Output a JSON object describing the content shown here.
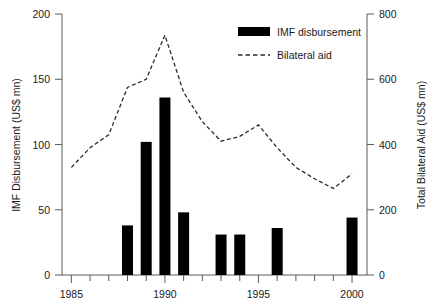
{
  "chart_data": {
    "type": "bar",
    "title": "",
    "xlabel": "",
    "ylabel": "IMF Disbursement (US$ mn)",
    "y2label": "Total Bilateral Aid (US$ mn)",
    "xlim": [
      1984.5,
      2000.8
    ],
    "ylim": [
      0,
      200
    ],
    "y2lim": [
      0,
      800
    ],
    "grid": false,
    "legend_position": "top-right",
    "x_ticks_major": [
      1985,
      1990,
      1995,
      2000
    ],
    "x_tick_labels": [
      "1985",
      "1990",
      "1995",
      "2000"
    ],
    "x_ticks_minor": [
      1986,
      1987,
      1988,
      1989,
      1991,
      1992,
      1993,
      1994,
      1996,
      1997,
      1998,
      1999
    ],
    "y_ticks": [
      0,
      50,
      100,
      150,
      200
    ],
    "y_tick_labels": [
      "0",
      "50",
      "100",
      "150",
      "200"
    ],
    "y2_ticks": [
      0,
      200,
      400,
      600,
      800
    ],
    "y2_tick_labels": [
      "0",
      "200",
      "400",
      "600",
      "800"
    ],
    "series": [
      {
        "name": "IMF disbursement",
        "type": "bar",
        "axis": "left",
        "color": "#000000",
        "categories": [
          1988,
          1989,
          1990,
          1991,
          1993,
          1994,
          1996,
          2000
        ],
        "values": [
          38,
          102,
          136,
          48,
          31,
          31,
          36,
          44
        ]
      },
      {
        "name": "Bilateral aid",
        "type": "line",
        "axis": "right",
        "color": "#2b2b2b",
        "style": "dashed",
        "x": [
          1985,
          1986,
          1987,
          1988,
          1989,
          1990,
          1991,
          1992,
          1993,
          1994,
          1995,
          1996,
          1997,
          1998,
          1999,
          2000
        ],
        "values": [
          330,
          390,
          430,
          575,
          600,
          735,
          560,
          470,
          410,
          425,
          460,
          390,
          330,
          295,
          265,
          310
        ]
      }
    ]
  },
  "legend": {
    "items": [
      {
        "label": "IMF disbursement",
        "marker": "filled-bar"
      },
      {
        "label": "Bilateral aid",
        "marker": "dashed-line"
      }
    ]
  }
}
